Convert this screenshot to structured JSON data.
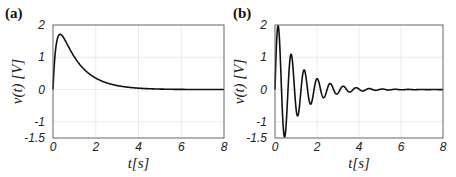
{
  "chart_data": [
    {
      "panel": "(a)",
      "type": "line",
      "title": "",
      "xlabel": "t[s]",
      "ylabel": "v(t) [V]",
      "xlim": [
        0,
        8
      ],
      "ylim": [
        -1.5,
        2
      ],
      "xticks": [
        0,
        2,
        4,
        6,
        8
      ],
      "yticks": [
        -1.5,
        -1,
        0,
        1,
        2
      ],
      "ytick_labels": [
        "-1.5",
        "-1",
        "0",
        "1",
        "2"
      ],
      "grid": true,
      "legend": null,
      "series": [
        {
          "name": "v(t)",
          "color": "#111111",
          "x": [
            0,
            0.1,
            0.2,
            0.3,
            0.5,
            0.75,
            1.0,
            1.5,
            2.0,
            2.5,
            3.0,
            4.0,
            5.0,
            6.0,
            8.0
          ],
          "y": [
            0,
            1.2,
            1.6,
            1.69,
            1.55,
            1.25,
            0.95,
            0.55,
            0.3,
            0.17,
            0.09,
            0.03,
            0.01,
            0.0,
            0.0
          ]
        }
      ]
    },
    {
      "panel": "(b)",
      "type": "line",
      "title": "",
      "xlabel": "t[s]",
      "ylabel": "v(t) [V]",
      "xlim": [
        0,
        8
      ],
      "ylim": [
        -1.5,
        2
      ],
      "xticks": [
        0,
        2,
        4,
        6,
        8
      ],
      "yticks": [
        -1.5,
        -1,
        0,
        1,
        2
      ],
      "ytick_labels": [
        "-1.5",
        "-1",
        "0",
        "1",
        "2"
      ],
      "grid": true,
      "legend": null,
      "series": [
        {
          "name": "v(t)",
          "color": "#111111",
          "x": [
            0,
            0.2,
            0.5,
            0.8,
            1.1,
            1.4,
            1.7,
            2.0,
            2.3,
            2.6,
            3.0,
            3.3,
            4.0,
            5.0,
            8.0
          ],
          "y": [
            0,
            1.72,
            -1.28,
            0.95,
            -0.68,
            0.5,
            -0.37,
            0.27,
            -0.2,
            0.15,
            -0.1,
            0.07,
            0.03,
            0.01,
            0.0
          ]
        }
      ]
    }
  ],
  "panels": [
    {
      "label": "(a)",
      "xlabel": "t[s]",
      "ylabel": "v(t) [V]"
    },
    {
      "label": "(b)",
      "xlabel": "t[s]",
      "ylabel": "v(t) [V]"
    }
  ]
}
